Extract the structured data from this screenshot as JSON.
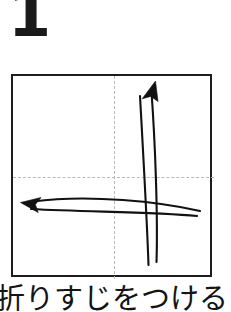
{
  "step": {
    "number": "1"
  },
  "caption": {
    "text": "折りすじをつける"
  },
  "diagram": {
    "paper": {
      "shape": "square",
      "fill": "#ffffff",
      "stroke": "#1d1d1d",
      "stroke_width": 2
    },
    "creases": [
      {
        "name": "vertical-center-crease",
        "orientation": "vertical",
        "style": "dashed",
        "color": "#b9b9b9"
      },
      {
        "name": "horizontal-center-crease",
        "orientation": "horizontal",
        "style": "dashed",
        "color": "#b9b9b9"
      }
    ],
    "arrows": [
      {
        "name": "fold-arrow-up",
        "direction": "up",
        "head": "solid-concave-triangle",
        "color": "#111111",
        "description": "curved valley-fold arrow sweeping from bottom-center upward to top"
      },
      {
        "name": "fold-arrow-left",
        "direction": "left",
        "head": "solid-concave-triangle",
        "color": "#111111",
        "description": "curved valley-fold arrow sweeping from right edge leftward"
      }
    ]
  }
}
